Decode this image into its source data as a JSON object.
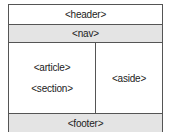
{
  "diagram": {
    "regions": {
      "header": "<header>",
      "nav": "<nav>",
      "article": "<article>",
      "section": "<section>",
      "aside": "<aside>",
      "footer": "<footer>"
    },
    "colors": {
      "border": "#555555",
      "shaded_fill": "#e4e4e4",
      "plain_fill": "#ffffff",
      "text": "#222222"
    }
  }
}
